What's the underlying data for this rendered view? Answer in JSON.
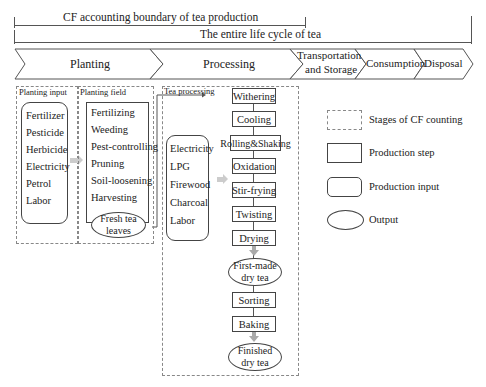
{
  "boundaries": {
    "cf_boundary": "CF accounting boundary of tea production",
    "life_cycle": "The entire life cycle of tea"
  },
  "stages": [
    {
      "label": "Planting"
    },
    {
      "label": "Processing"
    },
    {
      "label_line1": "Transportation",
      "label_line2": "and Storage"
    },
    {
      "label": "Consumption"
    },
    {
      "label": "Disposal"
    }
  ],
  "planting": {
    "input_title": "Planting input",
    "inputs": [
      "Fertilizer",
      "Pesticide",
      "Herbicide",
      "Electricity",
      "Petrol",
      "Labor"
    ],
    "field_title": "Planting field",
    "steps": [
      "Fertilizing",
      "Weeding",
      "Pest-controlling",
      "Pruning",
      "Soil-loosening",
      "Harvesting"
    ],
    "output_line1": "Fresh tea",
    "output_line2": "leaves"
  },
  "processing": {
    "title": "Tea processing",
    "inputs": [
      "Electricity",
      "LPG",
      "Firewood",
      "Charcoal",
      "Labor"
    ],
    "steps": [
      "Withering",
      "Cooling",
      "Rolling&Shaking",
      "Oxidation",
      "Stir-frying",
      "Twisting",
      "Drying"
    ],
    "intermediate_line1": "First-made",
    "intermediate_line2": "dry tea",
    "steps2": [
      "Sorting",
      "Baking"
    ],
    "final_line1": "Finished",
    "final_line2": "dry tea"
  },
  "legend": [
    {
      "shape": "dashed-rect",
      "label": "Stages of CF counting"
    },
    {
      "shape": "rect",
      "label": "Production step"
    },
    {
      "shape": "rounded-rect",
      "label": "Production input"
    },
    {
      "shape": "oval",
      "label": "Output"
    }
  ]
}
